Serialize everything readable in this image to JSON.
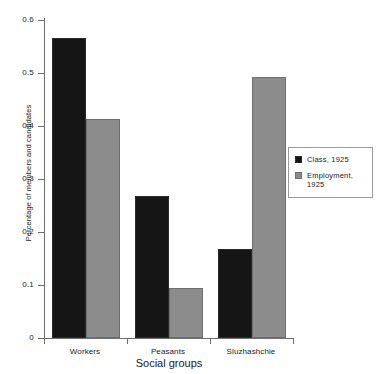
{
  "chart_data": {
    "type": "bar",
    "title": "",
    "xlabel": "Social groups",
    "ylabel": "Percentage of members and candidates",
    "categories": [
      "Workers",
      "Peasants",
      "Sluzhashchie"
    ],
    "series": [
      {
        "name": "Class, 1925",
        "color": "#151515",
        "values": [
          0.567,
          0.268,
          0.168
        ]
      },
      {
        "name": "Employment, 1925",
        "color": "#8c8c8c",
        "values": [
          0.413,
          0.095,
          0.493
        ]
      }
    ],
    "ylim": [
      0,
      0.6
    ],
    "yticks": [
      0,
      0.1,
      0.2,
      0.3,
      0.4,
      0.5,
      0.6
    ],
    "ytick_labels": [
      "0",
      "0.1",
      "0.2",
      "0.3",
      "0.4",
      "0.5",
      "0.6"
    ],
    "grid": false,
    "legend_position": "right",
    "legend_entries": [
      "Class, 1925",
      "Employment, 1925"
    ]
  },
  "axis": {
    "y_title": "Percentage of members and candidates",
    "x_title": "Social groups",
    "y_labels": {
      "t0": "0",
      "t1": "0.1",
      "t2": "0.2",
      "t3": "0.3",
      "t4": "0.4",
      "t5": "0.5",
      "t6": "0.6"
    },
    "x_labels": {
      "c0": "Workers",
      "c1": "Peasants",
      "c2": "Sluzhashchie"
    }
  },
  "legend": {
    "entry_class": "Class, 1925",
    "entry_employment_line1": "Employment,",
    "entry_employment_line2": "1925"
  }
}
